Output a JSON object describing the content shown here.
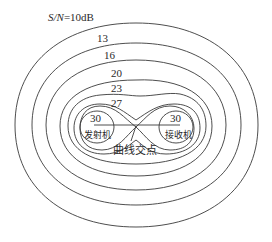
{
  "diagram": {
    "title_label": "S/N=10dB",
    "title_prefix_italic": "S/N",
    "title_suffix": "=10dB",
    "contours": [
      {
        "label": "10",
        "display": "S/N=10dB"
      },
      {
        "label": "13"
      },
      {
        "label": "16"
      },
      {
        "label": "20"
      },
      {
        "label": "23"
      },
      {
        "label": "27"
      },
      {
        "label": "30"
      }
    ],
    "transmitter": {
      "value": "30",
      "label": "发射机"
    },
    "receiver": {
      "value": "30",
      "label": "接收机"
    },
    "intersection_label": "曲线交点",
    "colors": {
      "line": "#3a3a3a",
      "text": "#2a2a2a",
      "background": "#ffffff"
    }
  }
}
